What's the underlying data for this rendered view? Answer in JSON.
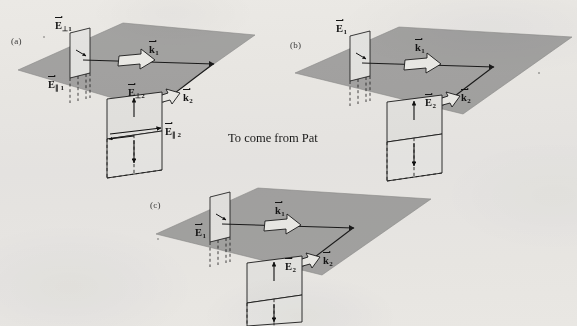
{
  "figure": {
    "background_color": "#f3f2f0",
    "plane_fill": "#a9a9a9",
    "sheet_fill": "#e9e9e7",
    "line_color": "#1b1b1b",
    "note": "To come from Pat"
  },
  "panels": [
    {
      "id": "a",
      "label": "(a)",
      "labels": [
        {
          "name": "E-perp-1",
          "symbol": "E",
          "subscript": "⊥1",
          "x": 55,
          "y": 21
        },
        {
          "name": "E-par-1",
          "symbol": "E",
          "subscript": "∥ 1",
          "x": 48,
          "y": 80
        },
        {
          "name": "k-1",
          "symbol": "k",
          "subscript": "1",
          "x": 149,
          "y": 45
        },
        {
          "name": "E-perp-2",
          "symbol": "E",
          "subscript": "⊥2",
          "x": 128,
          "y": 88
        },
        {
          "name": "E-par-2",
          "symbol": "E",
          "subscript": "∥ 2",
          "x": 165,
          "y": 127
        },
        {
          "name": "k-2",
          "symbol": "k",
          "subscript": "2",
          "x": 183,
          "y": 93
        }
      ]
    },
    {
      "id": "b",
      "label": "(b)",
      "labels": [
        {
          "name": "E-1",
          "symbol": "E",
          "subscript": "1",
          "x": 336,
          "y": 24
        },
        {
          "name": "k-1",
          "symbol": "k",
          "subscript": "1",
          "x": 415,
          "y": 43
        },
        {
          "name": "E-2",
          "symbol": "E",
          "subscript": "2",
          "x": 425,
          "y": 98
        },
        {
          "name": "k-2",
          "symbol": "k",
          "subscript": "2",
          "x": 461,
          "y": 93
        }
      ]
    },
    {
      "id": "c",
      "label": "(c)",
      "labels": [
        {
          "name": "E-1",
          "symbol": "E",
          "subscript": "1",
          "x": 195,
          "y": 228
        },
        {
          "name": "k-1",
          "symbol": "k",
          "subscript": "1",
          "x": 275,
          "y": 206
        },
        {
          "name": "E-2",
          "symbol": "E",
          "subscript": "2",
          "x": 285,
          "y": 262
        },
        {
          "name": "k-2",
          "symbol": "k",
          "subscript": "2",
          "x": 323,
          "y": 256
        }
      ]
    }
  ],
  "panel_letters": [
    {
      "id": "a",
      "text": "(a)",
      "x": 11,
      "y": 36
    },
    {
      "id": "b",
      "text": "(b)",
      "x": 290,
      "y": 40
    },
    {
      "id": "c",
      "text": "(c)",
      "x": 150,
      "y": 200
    }
  ],
  "note": {
    "text": "To come from Pat",
    "x": 228,
    "y": 131
  }
}
